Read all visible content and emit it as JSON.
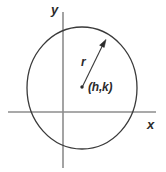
{
  "figure": {
    "kind": "circle-with-radius-diagram",
    "width": 166,
    "height": 172,
    "background_color": "#ffffff"
  },
  "axes": {
    "x_axis": {
      "label": "x",
      "color": "#8c8c8c",
      "y_position": 112,
      "x_start": 8,
      "x_end": 156
    },
    "y_axis": {
      "label": "y",
      "color": "#8c8c8c",
      "x_position": 63,
      "y_start": 12,
      "y_end": 168
    }
  },
  "circle": {
    "center_x": 82,
    "center_y": 88,
    "radius_x": 55,
    "radius_y": 61,
    "stroke_color": "#3a3a3a",
    "stroke_width": 1.3,
    "fill": "none"
  },
  "radius_arrow": {
    "label": "r",
    "from_x": 82,
    "from_y": 87,
    "to_x": 105,
    "to_y": 41,
    "stroke_color": "#3a3a3a"
  },
  "center_point": {
    "label": "(h,k)",
    "x": 82,
    "y": 87,
    "dot_color": "#2b2b2b",
    "dot_radius": 1.6
  },
  "colors": {
    "axis": "#8c8c8c",
    "curve": "#3a3a3a",
    "text": "#2b2b2b"
  }
}
